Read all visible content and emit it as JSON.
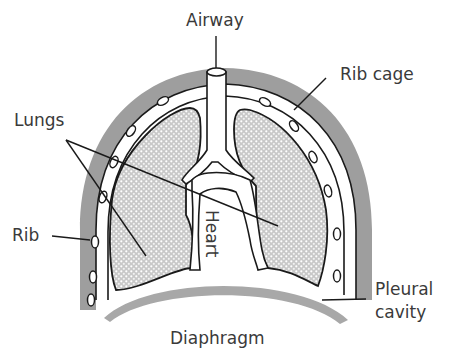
{
  "diagram": {
    "type": "anatomical-cross-section",
    "labels": {
      "airway": "Airway",
      "rib_cage": "Rib cage",
      "lungs": "Lungs",
      "rib": "Rib",
      "heart": "Heart",
      "pleural_cavity_line1": "Pleural",
      "pleural_cavity_line2": "cavity",
      "diaphragm": "Diaphragm"
    },
    "colors": {
      "rib_cage": "#9e9e9e",
      "diaphragm": "#a8a8a8",
      "lung_fill": "#d4d4d4",
      "outline": "#1a1a1a",
      "text": "#3a3a3a",
      "background": "#ffffff"
    }
  }
}
